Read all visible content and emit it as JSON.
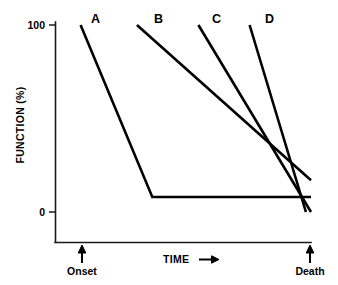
{
  "chart_data": {
    "type": "line",
    "title": "",
    "subtitle": "",
    "xlabel": "TIME",
    "ylabel": "FUNCTION (%)",
    "xlim": [
      0,
      100
    ],
    "ylim": [
      0,
      100
    ],
    "grid": false,
    "legend_position": "inline-line-labels",
    "x_tick_labels": [
      "Onset",
      "Death"
    ],
    "x_tick_values": [
      10,
      100
    ],
    "y_tick_labels": [
      "100",
      "0"
    ],
    "y_tick_values": [
      100,
      0
    ],
    "x_axis_arrow": "➡",
    "annotations": [
      {
        "name": "onset-marker",
        "label": "Onset",
        "x": 10,
        "arrow": "up"
      },
      {
        "name": "death-marker",
        "label": "Death",
        "x": 100,
        "arrow": "up"
      }
    ],
    "series": [
      {
        "name": "A",
        "label": "A",
        "color": "#000000",
        "description": "Sudden early decline then prolonged low plateau",
        "points": [
          {
            "x": 10,
            "y": 100
          },
          {
            "x": 38,
            "y": 8
          },
          {
            "x": 100,
            "y": 8
          }
        ]
      },
      {
        "name": "B",
        "label": "B",
        "color": "#000000",
        "description": "Gradual steady decline ending above zero",
        "points": [
          {
            "x": 32,
            "y": 100
          },
          {
            "x": 100,
            "y": 17
          }
        ]
      },
      {
        "name": "C",
        "label": "C",
        "color": "#000000",
        "description": "Later onset, steeper decline to zero",
        "points": [
          {
            "x": 56,
            "y": 100
          },
          {
            "x": 100,
            "y": 0
          }
        ]
      },
      {
        "name": "D",
        "label": "D",
        "color": "#000000",
        "description": "Latest onset, steepest and most rapid decline to zero",
        "points": [
          {
            "x": 76,
            "y": 100
          },
          {
            "x": 98,
            "y": 0
          }
        ]
      }
    ],
    "series_label_positions": [
      {
        "name": "A",
        "px": 91,
        "py": 23
      },
      {
        "name": "B",
        "px": 154,
        "py": 23
      },
      {
        "name": "C",
        "px": 212,
        "py": 23
      },
      {
        "name": "D",
        "px": 265,
        "py": 23
      }
    ]
  },
  "axes": {
    "y_title": "FUNCTION (%)",
    "x_title": "TIME",
    "y_top_tick": "100",
    "y_bottom_tick": "0"
  },
  "labels": {
    "onset": "Onset",
    "death": "Death",
    "series_a": "A",
    "series_b": "B",
    "series_c": "C",
    "series_d": "D"
  }
}
